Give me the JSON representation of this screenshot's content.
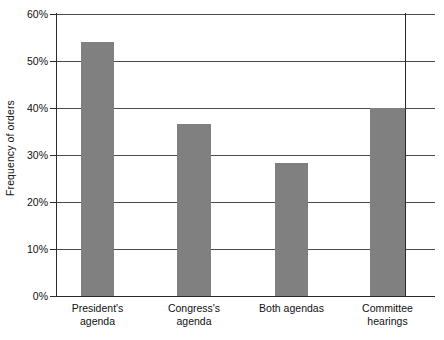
{
  "chart_data": {
    "type": "bar",
    "title": "",
    "xlabel": "",
    "ylabel": "Frequency of orders",
    "categories": [
      "President's agenda",
      "Congress's agenda",
      "Both agendas",
      "Committee hearings"
    ],
    "category_lines": [
      [
        "President's",
        "agenda"
      ],
      [
        "Congress's",
        "agenda"
      ],
      [
        "Both agendas",
        ""
      ],
      [
        "Committee",
        "hearings"
      ]
    ],
    "values": [
      54,
      36.5,
      28.4,
      40
    ],
    "value_labels": [
      "54%",
      "36.5%",
      "28.4%",
      "40%"
    ],
    "ylim": [
      0,
      60
    ],
    "yticks": [
      0,
      10,
      20,
      30,
      40,
      50,
      60
    ],
    "ytick_labels": [
      "0%",
      "10%",
      "20%",
      "30%",
      "40%",
      "50%",
      "60%"
    ],
    "grid": true,
    "grid_axis": "y",
    "legend": false,
    "legend_position": "none",
    "bar_color": "#808080",
    "axis_color": "#2b2b2b",
    "gridline_color": "#4a4a4a",
    "background": "#ffffff"
  },
  "axes": {
    "y_title": "Frequency of orders"
  }
}
